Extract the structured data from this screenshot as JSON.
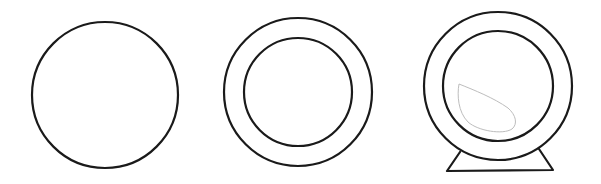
{
  "diagram": {
    "stroke_color": "#1a1a1a",
    "highlight_color": "#bdbdbd",
    "background": "#ffffff",
    "steps": [
      {
        "id": 1,
        "label": "circle",
        "shapes": [
          "outer-circle"
        ]
      },
      {
        "id": 2,
        "label": "concentric circles",
        "shapes": [
          "outer-circle",
          "inner-circle"
        ]
      },
      {
        "id": 3,
        "label": "mirror with stand",
        "shapes": [
          "outer-circle",
          "inner-circle",
          "glare-highlight",
          "stand"
        ]
      }
    ]
  }
}
